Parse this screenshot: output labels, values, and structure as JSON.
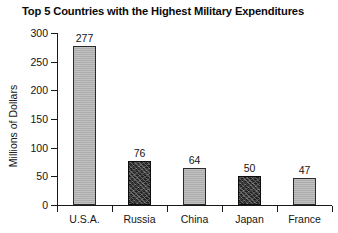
{
  "chart_data": {
    "type": "bar",
    "title": "Top 5 Countries with the Highest Military Expenditures",
    "xlabel": "",
    "ylabel": "Millions of Dollars",
    "categories": [
      "U.S.A.",
      "Russia",
      "China",
      "Japan",
      "France"
    ],
    "values": [
      277,
      76,
      64,
      50,
      47
    ],
    "value_labels": [
      "277",
      "76",
      "64",
      "50",
      "47"
    ],
    "ylim": [
      0,
      300
    ],
    "yticks": [
      0,
      50,
      100,
      150,
      200,
      250,
      300
    ],
    "ytick_labels": [
      "0",
      "50",
      "100",
      "150",
      "200",
      "250",
      "300"
    ],
    "grid": false,
    "legend": false,
    "bar_styles": [
      "light",
      "dark",
      "light",
      "dark",
      "light"
    ],
    "colors": {
      "bar_light": "#b3b3b3",
      "bar_dark": "#1f1f1f",
      "bar_border": "#2a2a2a",
      "axis": "#1a1a1a",
      "text": "#141414",
      "background": "#ffffff"
    }
  }
}
